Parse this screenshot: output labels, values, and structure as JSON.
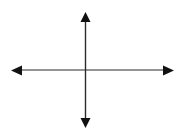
{
  "diagram": {
    "type": "coordinate-axes",
    "colors": {
      "background": "#ffffff",
      "axis_line": "#2a2a2a",
      "arrowhead": "#111111"
    },
    "horizontal_axis": {
      "y": 70,
      "x_start": 11,
      "x_end": 174,
      "arrows": [
        "left",
        "right"
      ]
    },
    "vertical_axis": {
      "x": 85,
      "y_start": 12,
      "y_end": 128,
      "arrows": [
        "up",
        "down"
      ]
    },
    "labels": []
  }
}
